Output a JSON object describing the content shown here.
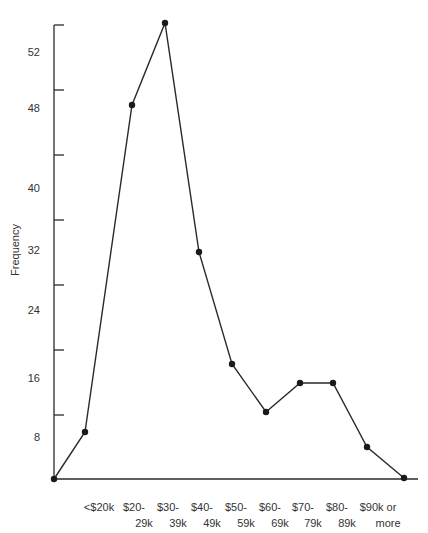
{
  "chart_data": {
    "type": "line",
    "subtype": "frequency-polygon",
    "title": "",
    "xlabel": "",
    "ylabel": "Frequency",
    "categories": [
      "<$20k",
      "$20-29k",
      "$30-39k",
      "$40-49k",
      "$50-59k",
      "$60-69k",
      "$70-79k",
      "$80-89k",
      "$90k or more"
    ],
    "category_labels": [
      [
        "<$20k",
        ""
      ],
      [
        "$20-",
        "29k"
      ],
      [
        "$30-",
        "39k"
      ],
      [
        "$40-",
        "49k"
      ],
      [
        "$50-",
        "59k"
      ],
      [
        "$60-",
        "69k"
      ],
      [
        "$70-",
        "79k"
      ],
      [
        "$80-",
        "89k"
      ],
      [
        "$90k or",
        "more"
      ]
    ],
    "values": [
      9,
      49,
      55,
      32,
      18,
      12,
      16,
      16,
      7
    ],
    "endpoints": {
      "start": 0,
      "end": 0
    },
    "y_tick_labels": [
      "8",
      "16",
      "24",
      "32",
      "40",
      "48",
      "52"
    ],
    "ylim": [
      0,
      56
    ],
    "grid": false,
    "legend": null,
    "line_color": "#2a2a2a",
    "marker": "filled-circle"
  },
  "render": {
    "origin": {
      "x": 54,
      "y": 479
    },
    "axis_top_y": 25,
    "x_axis_end": 418,
    "y_ticks_px": [
      25,
      90,
      155,
      220,
      285,
      350,
      415
    ],
    "y_tick_label_px": [
      437,
      378,
      310,
      250,
      188,
      108,
      52
    ],
    "points_px": [
      [
        54,
        479
      ],
      [
        85,
        432
      ],
      [
        132,
        105
      ],
      [
        165,
        23
      ],
      [
        199,
        252
      ],
      [
        232,
        364
      ],
      [
        266,
        412
      ],
      [
        300,
        383
      ],
      [
        333,
        383
      ],
      [
        367,
        447
      ],
      [
        404,
        478
      ]
    ],
    "cat_label_x": [
      101,
      136,
      170,
      204,
      238,
      272,
      305,
      339,
      380
    ]
  }
}
